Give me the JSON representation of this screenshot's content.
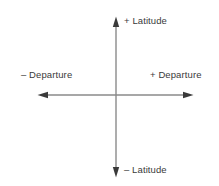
{
  "diagram": {
    "background_color": "#ffffff",
    "axis_line_color": "#8a8a8a",
    "arrowhead_color": "#3a3a3a",
    "text_color": "#3a3a3a",
    "origin": {
      "x": 116,
      "y": 95
    },
    "labels": {
      "top": "+ Latitude",
      "bottom": "– Latitude",
      "left": "– Departure",
      "right": "+ Departure"
    },
    "axes": [
      {
        "name": "vertical-axis",
        "orientation": "vertical",
        "from": {
          "x": 116,
          "y": 177
        },
        "to": {
          "x": 116,
          "y": 17
        },
        "arrowheads": [
          "start",
          "end"
        ],
        "positive_direction": "up",
        "positive_label": "+ Latitude",
        "negative_label": "– Latitude"
      },
      {
        "name": "horizontal-axis",
        "orientation": "horizontal",
        "from": {
          "x": 38,
          "y": 95
        },
        "to": {
          "x": 193,
          "y": 95
        },
        "arrowheads": [
          "start",
          "end"
        ],
        "positive_direction": "right",
        "positive_label": "+ Departure",
        "negative_label": "– Departure"
      }
    ]
  }
}
